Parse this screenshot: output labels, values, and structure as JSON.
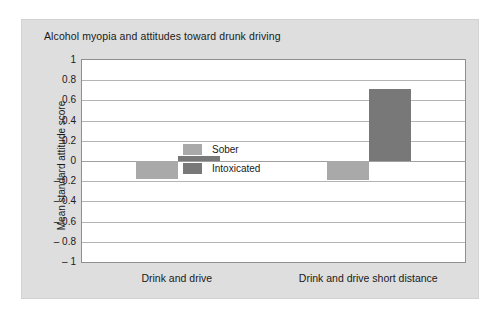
{
  "chart_data": {
    "type": "bar",
    "title": "Alcohol myopia and attitudes toward drunk driving",
    "xlabel": "",
    "ylabel": "Mean standard attitude score",
    "categories": [
      "Drink and drive",
      "Drink and drive short distance"
    ],
    "series": [
      {
        "name": "Sober",
        "color": "#a9a9a9",
        "values": [
          -0.18,
          -0.19
        ]
      },
      {
        "name": "Intoxicated",
        "color": "#787878",
        "values": [
          0.05,
          0.71
        ]
      }
    ],
    "ylim": [
      -1,
      1
    ],
    "yticks": [
      1,
      0.8,
      0.6,
      0.4,
      0.2,
      0,
      -0.2,
      -0.4,
      -0.6,
      -0.8,
      -1
    ],
    "ytick_labels": [
      "1",
      "0.8",
      "0.6",
      "0.4",
      "0.2",
      "0",
      "– 0.2",
      "– 0.4",
      "– 0.6",
      "– 0.8",
      "– 1"
    ],
    "grid": true,
    "legend_position": "inside-top-left"
  },
  "colors": {
    "panel_background": "#dedede",
    "plot_background": "#ffffff",
    "gridline": "#b4b4b4",
    "axis": "#8f8f8f",
    "text": "#1a1a1a",
    "sober": "#a9a9a9",
    "intoxicated": "#787878"
  }
}
